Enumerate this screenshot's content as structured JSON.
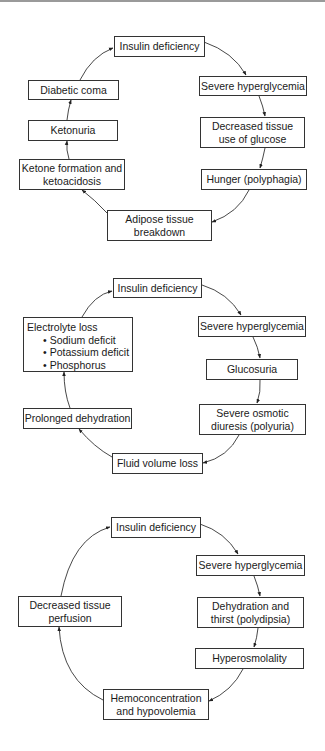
{
  "diagrams": [
    {
      "name": "ketoacidosis-cycle",
      "nodes": [
        {
          "id": "d1-insulin",
          "lines": [
            "Insulin deficiency"
          ]
        },
        {
          "id": "d1-hyperglycemia",
          "lines": [
            "Severe hyperglycemia"
          ]
        },
        {
          "id": "d1-decreased-glucose-use",
          "lines": [
            "Decreased tissue",
            "use of glucose"
          ]
        },
        {
          "id": "d1-hunger",
          "lines": [
            "Hunger (polyphagia)"
          ]
        },
        {
          "id": "d1-adipose",
          "lines": [
            "Adipose tissue",
            "breakdown"
          ]
        },
        {
          "id": "d1-ketone",
          "lines": [
            "Ketone formation and",
            "ketoacidosis"
          ]
        },
        {
          "id": "d1-ketonuria",
          "lines": [
            "Ketonuria"
          ]
        },
        {
          "id": "d1-coma",
          "lines": [
            "Diabetic coma"
          ]
        }
      ]
    },
    {
      "name": "dehydration-electrolyte-cycle",
      "nodes": [
        {
          "id": "d2-insulin",
          "lines": [
            "Insulin deficiency"
          ]
        },
        {
          "id": "d2-hyperglycemia",
          "lines": [
            "Severe hyperglycemia"
          ]
        },
        {
          "id": "d2-glucosuria",
          "lines": [
            "Glucosuria"
          ]
        },
        {
          "id": "d2-diuresis",
          "lines": [
            "Severe osmotic",
            "diuresis (polyuria)"
          ]
        },
        {
          "id": "d2-fluid-loss",
          "lines": [
            "Fluid volume loss"
          ]
        },
        {
          "id": "d2-prolonged-dehydration",
          "lines": [
            "Prolonged dehydration"
          ]
        },
        {
          "id": "d2-electrolyte",
          "title": "Electrolyte loss",
          "bullets": [
            "Sodium deficit",
            "Potassium deficit",
            "Phosphorus"
          ]
        }
      ]
    },
    {
      "name": "perfusion-cycle",
      "nodes": [
        {
          "id": "d3-insulin",
          "lines": [
            "Insulin deficiency"
          ]
        },
        {
          "id": "d3-hyperglycemia",
          "lines": [
            "Severe hyperglycemia"
          ]
        },
        {
          "id": "d3-dehydration",
          "lines": [
            "Dehydration and",
            "thirst (polydipsia)"
          ]
        },
        {
          "id": "d3-hyperosmolality",
          "lines": [
            "Hyperosmolality"
          ]
        },
        {
          "id": "d3-hemoconcentration",
          "lines": [
            "Hemoconcentration",
            "and hypovolemia"
          ]
        },
        {
          "id": "d3-perfusion",
          "lines": [
            "Decreased tissue",
            "perfusion"
          ]
        }
      ]
    }
  ]
}
